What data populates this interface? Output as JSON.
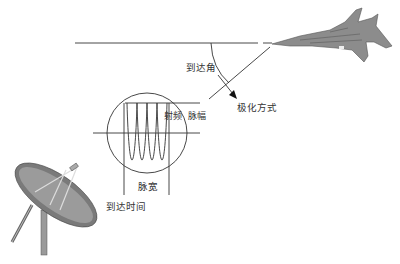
{
  "diagram": {
    "title": "",
    "colors": {
      "line": "#222222",
      "text": "#333333",
      "aircraft_fill": "#8c8c8c",
      "dish_fill": "#7a7a7a"
    },
    "labels": {
      "arrival_angle": "到达角",
      "polarization": "极化方式",
      "radio_frequency": "射频",
      "pulse_amplitude": "脉幅",
      "pulse_width": "脉宽",
      "arrival_time": "到达时间"
    },
    "elements": {
      "aircraft": "fighter-jet-icon",
      "antenna": "radar-dish-icon",
      "pulse": "rf-pulse-waveform"
    }
  }
}
